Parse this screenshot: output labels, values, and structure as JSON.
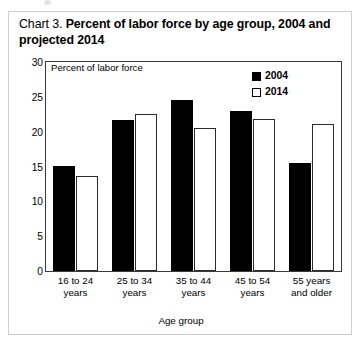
{
  "title": {
    "prefix": "Chart 3.",
    "main": "Percent of labor force by age group, 2004 and projected 2014"
  },
  "axis": {
    "y_title": "Percent of labor force",
    "x_title": "Age group"
  },
  "legend": {
    "items": [
      {
        "label": "2004",
        "color": "#000000",
        "style": "filled"
      },
      {
        "label": "2014",
        "color": "#ffffff",
        "style": "outlined"
      }
    ]
  },
  "chart_data": {
    "type": "bar",
    "title": "Chart 3. Percent of labor force by age group, 2004 and projected 2014",
    "xlabel": "Age group",
    "ylabel": "Percent of labor force",
    "ylim": [
      0,
      30
    ],
    "yticks": [
      0,
      5,
      10,
      15,
      20,
      25,
      30
    ],
    "ytick_labels": [
      "0",
      "5",
      "10",
      "15",
      "20",
      "25",
      "30"
    ],
    "grid": false,
    "legend_position": "top-right",
    "categories": [
      "16 to 24 years",
      "25 to 34 years",
      "35 to 44 years",
      "45 to 54 years",
      "55 years and older"
    ],
    "series": [
      {
        "name": "2004",
        "values": [
          15.1,
          21.7,
          24.5,
          23.0,
          15.5
        ]
      },
      {
        "name": "2014",
        "values": [
          13.6,
          22.6,
          20.5,
          21.8,
          21.1
        ]
      }
    ]
  }
}
